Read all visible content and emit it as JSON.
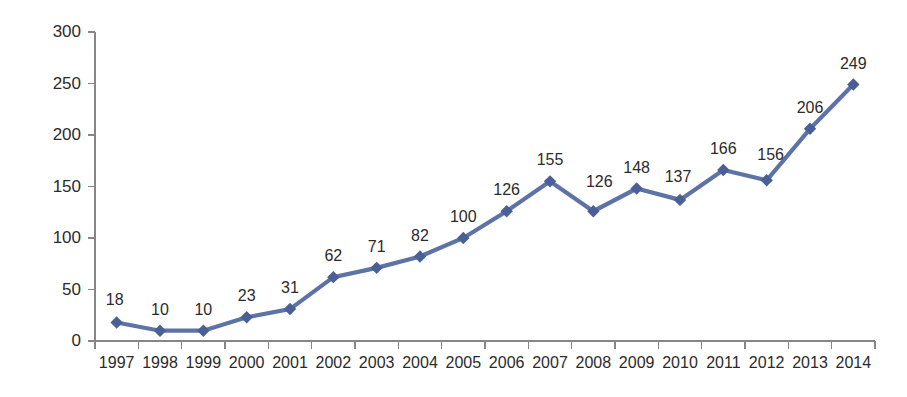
{
  "chart_data": {
    "type": "line",
    "title": "",
    "subtitle": "",
    "xlabel": "",
    "ylabel": "",
    "categories": [
      "1997",
      "1998",
      "1999",
      "2000",
      "2001",
      "2002",
      "2003",
      "2004",
      "2005",
      "2006",
      "2007",
      "2008",
      "2009",
      "2010",
      "2011",
      "2012",
      "2013",
      "2014"
    ],
    "values": [
      18,
      10,
      10,
      23,
      31,
      62,
      71,
      82,
      100,
      126,
      155,
      126,
      148,
      137,
      166,
      156,
      206,
      249
    ],
    "data_labels": [
      "18",
      "10",
      "10",
      "23",
      "31",
      "62",
      "71",
      "82",
      "100",
      "126",
      "155",
      "126",
      "148",
      "137",
      "166",
      "156",
      "206",
      "249"
    ],
    "ylim": [
      0,
      300
    ],
    "yticks": [
      0,
      50,
      100,
      150,
      200,
      250,
      300
    ],
    "ytick_labels": [
      "0",
      "50",
      "100",
      "150",
      "200",
      "250",
      "300"
    ],
    "grid": false,
    "legend": false,
    "legend_position": "none",
    "show_data_labels": true,
    "marker": "diamond",
    "series": [
      {
        "name": "",
        "values": [
          18,
          10,
          10,
          23,
          31,
          62,
          71,
          82,
          100,
          126,
          155,
          126,
          148,
          137,
          166,
          156,
          206,
          249
        ]
      }
    ]
  },
  "style": {
    "series_color": "#5D73A6",
    "marker_color": "#4A5F94",
    "axis_color": "#868686",
    "label_color": "#2b2b2b",
    "background": "#ffffff"
  }
}
